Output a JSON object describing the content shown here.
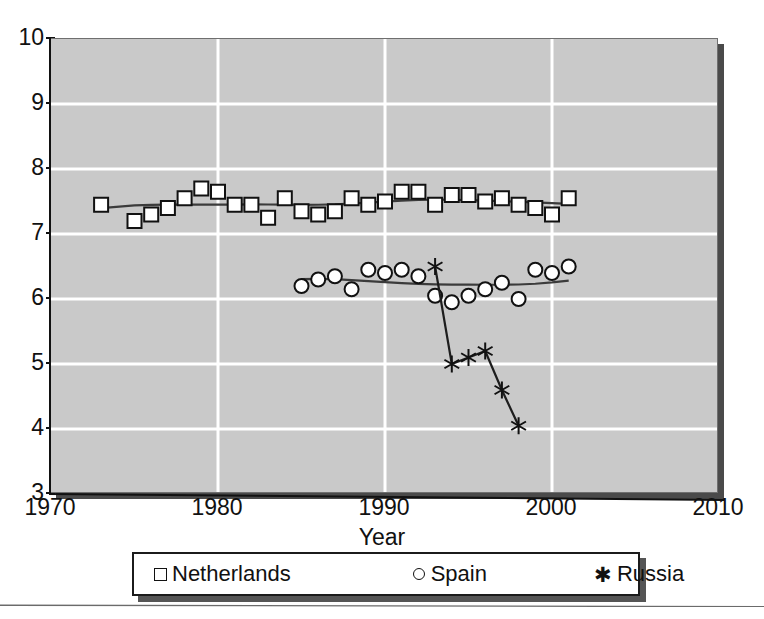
{
  "chart_data": {
    "type": "scatter",
    "title": "",
    "xlabel": "Year",
    "ylabel": "",
    "xlim": [
      1970,
      2010
    ],
    "ylim": [
      3,
      10
    ],
    "xticks": [
      1970,
      1980,
      1990,
      2000,
      2010
    ],
    "yticks": [
      3,
      4,
      5,
      6,
      7,
      8,
      9,
      10
    ],
    "grid": true,
    "grid_color": "#ffffff",
    "plot_background": "#c9c9c9",
    "legend_position": "below-axes",
    "series": [
      {
        "name": "Netherlands",
        "marker": "open-square",
        "has_trend_line": true,
        "x": [
          1973,
          1975,
          1976,
          1977,
          1978,
          1979,
          1980,
          1981,
          1982,
          1983,
          1984,
          1985,
          1986,
          1987,
          1988,
          1989,
          1990,
          1991,
          1992,
          1993,
          1994,
          1995,
          1996,
          1997,
          1998,
          1999,
          2000,
          2001
        ],
        "y": [
          7.45,
          7.2,
          7.3,
          7.4,
          7.55,
          7.7,
          7.65,
          7.45,
          7.45,
          7.25,
          7.55,
          7.35,
          7.3,
          7.35,
          7.55,
          7.45,
          7.5,
          7.65,
          7.65,
          7.45,
          7.6,
          7.6,
          7.5,
          7.55,
          7.45,
          7.4,
          7.3,
          7.55
        ]
      },
      {
        "name": "Spain",
        "marker": "open-circle",
        "has_trend_line": true,
        "x": [
          1985,
          1986,
          1987,
          1988,
          1989,
          1990,
          1991,
          1992,
          1993,
          1994,
          1995,
          1996,
          1997,
          1998,
          1999,
          2000,
          2001
        ],
        "y": [
          6.2,
          6.3,
          6.35,
          6.15,
          6.45,
          6.4,
          6.45,
          6.35,
          6.05,
          5.95,
          6.05,
          6.15,
          6.25,
          6.0,
          6.45,
          6.4,
          6.5
        ]
      },
      {
        "name": "Russia",
        "marker": "star",
        "has_trend_line": false,
        "connected": true,
        "x": [
          1993,
          1994,
          1995,
          1996,
          1997,
          1998
        ],
        "y": [
          6.5,
          5.0,
          5.1,
          5.2,
          4.6,
          4.05
        ]
      }
    ]
  },
  "axis": {
    "y_tick_labels": [
      "10",
      "9",
      "8",
      "7",
      "6",
      "5",
      "4",
      "3"
    ],
    "x_tick_labels": [
      "1970",
      "1980",
      "1990",
      "2000",
      "2010"
    ],
    "x_axis_title": "Year"
  },
  "legend": {
    "items": [
      {
        "label": "Netherlands",
        "marker": "square-icon"
      },
      {
        "label": "Spain",
        "marker": "circle-icon"
      },
      {
        "label": "Russia",
        "marker": "star-icon"
      }
    ]
  },
  "colors": {
    "plot_bg": "#c9c9c9",
    "gridline": "#ffffff",
    "ink": "#111111",
    "shadow": "#4a4a4a"
  }
}
